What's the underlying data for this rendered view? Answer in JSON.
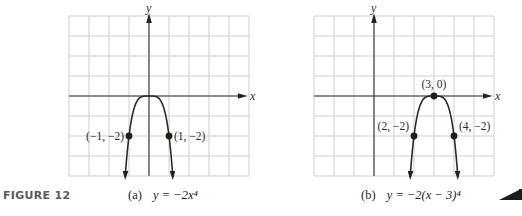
{
  "figure_label": "FIGURE 12",
  "chart_data": [
    {
      "type": "line",
      "id": "a",
      "caption_prefix": "(a)",
      "caption_equation": "y = −2x⁴",
      "function": "-2*x^4",
      "xlabel": "x",
      "ylabel": "y",
      "xlim": [
        -4,
        5
      ],
      "ylim": [
        -4,
        4
      ],
      "grid": true,
      "grid_step": 1,
      "points": [
        {
          "x": -1,
          "y": -2,
          "label": "(−1, −2)",
          "label_side": "left"
        },
        {
          "x": 1,
          "y": -2,
          "label": "(1, −2)",
          "label_side": "right"
        }
      ],
      "vertex_marked": false
    },
    {
      "type": "line",
      "id": "b",
      "caption_prefix": "(b)",
      "caption_equation": "y = −2(x − 3)⁴",
      "function": "-2*(x-3)^4",
      "xlabel": "x",
      "ylabel": "y",
      "xlim": [
        -3,
        6
      ],
      "ylim": [
        -4,
        4
      ],
      "grid": true,
      "grid_step": 1,
      "points": [
        {
          "x": 3,
          "y": 0,
          "label": "(3, 0)",
          "label_side": "top"
        },
        {
          "x": 2,
          "y": -2,
          "label": "(2, −2)",
          "label_side": "left"
        },
        {
          "x": 4,
          "y": -2,
          "label": "(4, −2)",
          "label_side": "right"
        }
      ],
      "vertex_marked": true
    }
  ]
}
